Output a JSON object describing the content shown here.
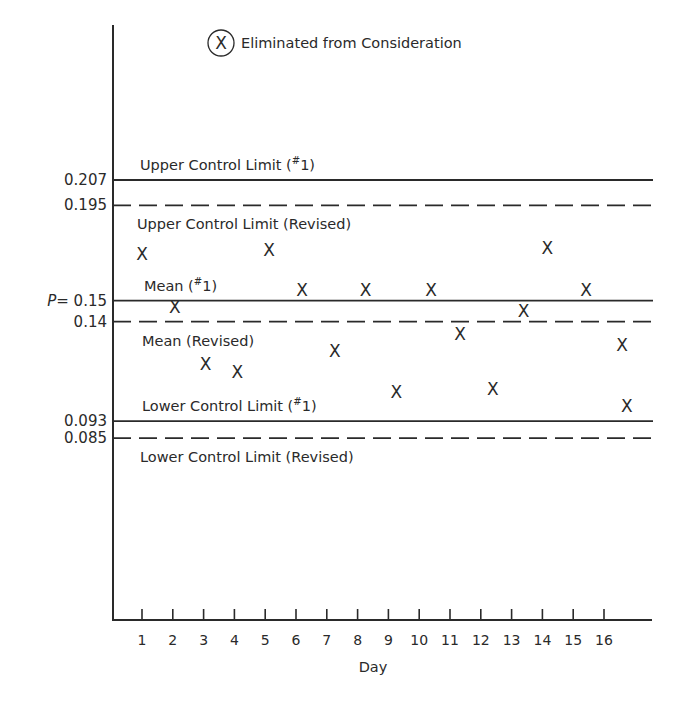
{
  "chart_data": {
    "type": "scatter",
    "title": "",
    "xlabel": "Day",
    "ylabel": "P",
    "x_ticks": [
      1,
      2,
      3,
      4,
      5,
      6,
      7,
      8,
      9,
      10,
      11,
      12,
      13,
      14,
      15,
      16
    ],
    "x_range": [
      0,
      17.3
    ],
    "ylim": [
      0.0,
      0.25
    ],
    "grid": false,
    "legend": {
      "symbol": "X",
      "symbol_circled": true,
      "label": "Eliminated from Consideration",
      "position": "top-center"
    },
    "y_tick_labels": [
      {
        "value": 0.207,
        "label": "0.207"
      },
      {
        "value": 0.195,
        "label": "0.195"
      },
      {
        "value": 0.15,
        "label": "0.15",
        "prefix": "P="
      },
      {
        "value": 0.14,
        "label": "0.14"
      },
      {
        "value": 0.093,
        "label": "0.093"
      },
      {
        "value": 0.085,
        "label": "0.085"
      }
    ],
    "reference_lines": [
      {
        "name": "Upper Control Limit (#1)",
        "value": 0.207,
        "style": "solid",
        "label_above": true,
        "label_x": 140
      },
      {
        "name": "Upper Control Limit (Revised)",
        "value": 0.195,
        "style": "dashed",
        "label_above": false,
        "label_x": 137
      },
      {
        "name": "Mean (#1)",
        "value": 0.15,
        "style": "solid",
        "label_above": true,
        "label_x": 144
      },
      {
        "name": "Mean (Revised)",
        "value": 0.14,
        "style": "dashed",
        "label_above": false,
        "label_x": 142
      },
      {
        "name": "Lower Control Limit (#1)",
        "value": 0.093,
        "style": "solid",
        "label_above": true,
        "label_x": 142
      },
      {
        "name": "Lower Control Limit (Revised)",
        "value": 0.085,
        "style": "dashed",
        "label_above": false,
        "label_x": 140
      }
    ],
    "series": [
      {
        "name": "Daily proportion defective",
        "marker": "X",
        "x": [
          1,
          2,
          3,
          4,
          5,
          6,
          7,
          8,
          9,
          10,
          11,
          12,
          13,
          14,
          15,
          16,
          17
        ],
        "values": [
          0.172,
          0.147,
          0.12,
          0.116,
          0.174,
          0.155,
          0.126,
          0.155,
          0.107,
          0.155,
          0.134,
          0.108,
          0.145,
          0.175,
          0.155,
          0.129,
          0.1
        ],
        "x_offsets_px": [
          0,
          2,
          2,
          3,
          4,
          6,
          8,
          8,
          8,
          12,
          10,
          12,
          12,
          5,
          13,
          18,
          11
        ]
      }
    ]
  },
  "legend_text": "Eliminated from Consideration",
  "legend_symbol": "X",
  "x_axis_label": "Day",
  "y_prefix": "P="
}
